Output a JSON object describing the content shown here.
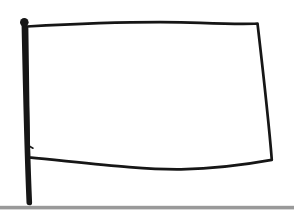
{
  "colors": {
    "background": "#ffffff",
    "ink": "#161616",
    "flag_fill": "#ffffff",
    "ground": "#999999"
  },
  "drawing": {
    "elements": [
      {
        "name": "flagpole",
        "kind": "thick vertical black stroke with round finial knob at top"
      },
      {
        "name": "flag",
        "kind": "hand-drawn blank rectangle attached to pole, white interior"
      },
      {
        "name": "ground-line",
        "kind": "horizontal gray bar across full width at bottom"
      }
    ]
  }
}
